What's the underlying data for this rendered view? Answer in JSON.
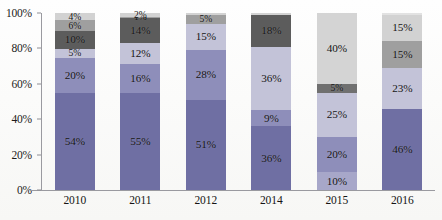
{
  "chart_data": {
    "type": "bar",
    "stacked": true,
    "normalized_percent": true,
    "title": "",
    "subtitle": "",
    "xlabel": "",
    "ylabel": "",
    "ylim": [
      0,
      100
    ],
    "ytick_labels": [
      "0%",
      "20%",
      "40%",
      "60%",
      "80%",
      "100%"
    ],
    "ytick_values": [
      0,
      20,
      40,
      60,
      80,
      100
    ],
    "grid": false,
    "legend": "none",
    "categories": [
      "2010",
      "2011",
      "2012",
      "2014",
      "2015",
      "2016"
    ],
    "palette": {
      "dark_purple": "#6f6fa3",
      "medium_lavender": "#8e8eba",
      "light_lavender": "#c3c3d8",
      "dark_gray": "#5c5c5c",
      "medium_gray": "#9f9f9f",
      "light_gray": "#d2d2d2"
    },
    "bars": [
      {
        "category": "2010",
        "segments": [
          {
            "value": 54,
            "label": "54%",
            "color": "#6f6fa3"
          },
          {
            "value": 20,
            "label": "20%",
            "color": "#8e8eba"
          },
          {
            "value": 5,
            "label": "5%",
            "color": "#c3c3d8"
          },
          {
            "value": 10,
            "label": "10%",
            "color": "#5c5c5c"
          },
          {
            "value": 6,
            "label": "6%",
            "color": "#9f9f9f"
          },
          {
            "value": 4,
            "label": "4%",
            "color": "#d2d2d2"
          }
        ]
      },
      {
        "category": "2011",
        "segments": [
          {
            "value": 55,
            "label": "55%",
            "color": "#6f6fa3"
          },
          {
            "value": 16,
            "label": "16%",
            "color": "#8e8eba"
          },
          {
            "value": 12,
            "label": "12%",
            "color": "#c3c3d8"
          },
          {
            "value": 14,
            "label": "14%",
            "color": "#5c5c5c"
          },
          {
            "value": 1,
            "label": "1%",
            "color": "#9f9f9f"
          },
          {
            "value": 2,
            "label": "2%",
            "color": "#d2d2d2"
          }
        ]
      },
      {
        "category": "2012",
        "segments": [
          {
            "value": 51,
            "label": "51%",
            "color": "#6f6fa3"
          },
          {
            "value": 28,
            "label": "28%",
            "color": "#8e8eba"
          },
          {
            "value": 15,
            "label": "15%",
            "color": "#c3c3d8"
          },
          {
            "value": 5,
            "label": "5%",
            "color": "#9f9f9f"
          },
          {
            "value": 1,
            "label": "",
            "color": "#d2d2d2"
          }
        ]
      },
      {
        "category": "2014",
        "segments": [
          {
            "value": 36,
            "label": "36%",
            "color": "#6f6fa3"
          },
          {
            "value": 9,
            "label": "9%",
            "color": "#8e8eba"
          },
          {
            "value": 36,
            "label": "36%",
            "color": "#c3c3d8"
          },
          {
            "value": 18,
            "label": "18%",
            "color": "#5c5c5c"
          },
          {
            "value": 1,
            "label": "",
            "color": "#d2d2d2"
          }
        ]
      },
      {
        "category": "2015",
        "segments": [
          {
            "value": 10,
            "label": "10%",
            "color": "#a7a7c9"
          },
          {
            "value": 20,
            "label": "20%",
            "color": "#8e8eba"
          },
          {
            "value": 25,
            "label": "25%",
            "color": "#c3c3d8"
          },
          {
            "value": 5,
            "label": "5%",
            "color": "#707070"
          },
          {
            "value": 40,
            "label": "40%",
            "color": "#d4d4d4"
          }
        ]
      },
      {
        "category": "2016",
        "segments": [
          {
            "value": 46,
            "label": "46%",
            "color": "#6f6fa3"
          },
          {
            "value": 23,
            "label": "23%",
            "color": "#c3c3d8"
          },
          {
            "value": 15,
            "label": "15%",
            "color": "#9f9f9f"
          },
          {
            "value": 15,
            "label": "15%",
            "color": "#d2d2d2"
          },
          {
            "value": 1,
            "label": "",
            "color": "#e2e2e2"
          }
        ]
      }
    ]
  }
}
